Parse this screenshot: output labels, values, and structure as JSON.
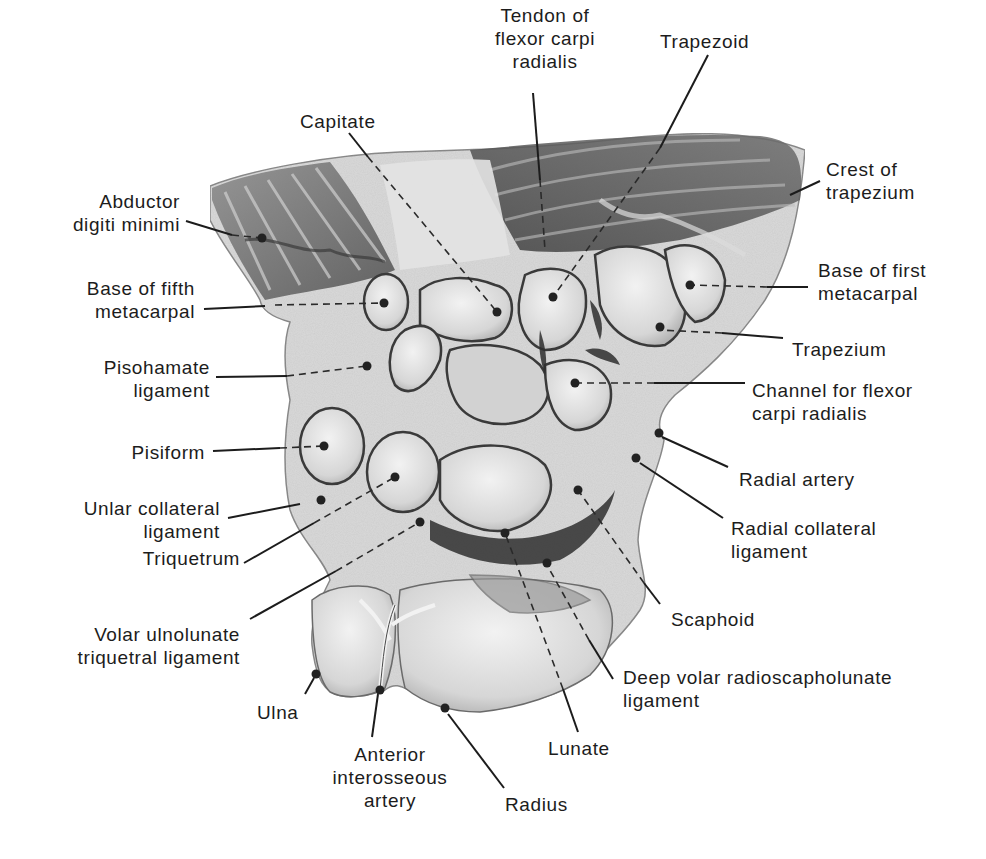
{
  "figure": {
    "labels": [
      {
        "id": "tendon-fcr",
        "text": "Tendon of\nflexor carpi\nradialis",
        "x": 470,
        "y": 4,
        "w": 150,
        "align": "center",
        "line": [
          [
            533,
            93
          ],
          [
            540,
            180
          ]
        ],
        "dash": [
          [
            540,
            180
          ],
          [
            545,
            250
          ]
        ],
        "dot": null
      },
      {
        "id": "trapezoid",
        "text": "Trapezoid",
        "x": 660,
        "y": 30,
        "w": 120,
        "align": "left",
        "line": [
          [
            708,
            55
          ],
          [
            660,
            148
          ]
        ],
        "dash": [
          [
            660,
            148
          ],
          [
            553,
            297
          ]
        ],
        "dot": [
          553,
          297
        ]
      },
      {
        "id": "capitate",
        "text": "Capitate",
        "x": 300,
        "y": 110,
        "w": 100,
        "align": "left",
        "line": [
          [
            349,
            133
          ],
          [
            368,
            157
          ]
        ],
        "dash": [
          [
            368,
            157
          ],
          [
            497,
            312
          ]
        ],
        "dot": [
          497,
          312
        ]
      },
      {
        "id": "crest-of-trapezium",
        "text": "Crest of\ntrapezium",
        "x": 826,
        "y": 158,
        "w": 140,
        "align": "left",
        "line": [
          [
            820,
            181
          ],
          [
            790,
            195
          ]
        ],
        "dash": null,
        "dot": null
      },
      {
        "id": "abductor-digiti-minimi",
        "text": "Abductor\ndigiti minimi",
        "x": 40,
        "y": 190,
        "w": 140,
        "align": "right",
        "line": [
          [
            186,
            221
          ],
          [
            232,
            235
          ]
        ],
        "dash": [
          [
            232,
            235
          ],
          [
            262,
            238
          ]
        ],
        "dot": [
          262,
          238
        ]
      },
      {
        "id": "base-of-fifth-metacarpal",
        "text": "Base of fifth\nmetacarpal",
        "x": 20,
        "y": 277,
        "w": 175,
        "align": "right",
        "line": [
          [
            204,
            309
          ],
          [
            265,
            306
          ]
        ],
        "dash": [
          [
            275,
            305
          ],
          [
            384,
            303
          ]
        ],
        "dot": [
          384,
          303
        ]
      },
      {
        "id": "base-of-first-metacarpal",
        "text": "Base of first\nmetacarpal",
        "x": 818,
        "y": 259,
        "w": 150,
        "align": "left",
        "line": [
          [
            808,
            287
          ],
          [
            767,
            287
          ]
        ],
        "dash": [
          [
            767,
            287
          ],
          [
            690,
            285
          ]
        ],
        "dot": [
          690,
          285
        ]
      },
      {
        "id": "trapezium",
        "text": "Trapezium",
        "x": 792,
        "y": 338,
        "w": 140,
        "align": "left",
        "line": [
          [
            783,
            338
          ],
          [
            722,
            333
          ]
        ],
        "dash": [
          [
            722,
            333
          ],
          [
            660,
            330
          ]
        ],
        "dot": [
          660,
          327
        ]
      },
      {
        "id": "pisohamate-ligament",
        "text": "Pisohamate\nligament",
        "x": 40,
        "y": 356,
        "w": 170,
        "align": "right",
        "line": [
          [
            216,
            377
          ],
          [
            287,
            376
          ]
        ],
        "dash": [
          [
            287,
            376
          ],
          [
            367,
            366
          ]
        ],
        "dot": [
          367,
          366
        ]
      },
      {
        "id": "channel-fcr",
        "text": "Channel for flexor\ncarpi radialis",
        "x": 752,
        "y": 379,
        "w": 210,
        "align": "left",
        "line": [
          [
            745,
            383
          ],
          [
            654,
            383
          ]
        ],
        "dash": [
          [
            654,
            383
          ],
          [
            575,
            383
          ]
        ],
        "dot": [
          575,
          383
        ]
      },
      {
        "id": "pisiform",
        "text": "Pisiform",
        "x": 95,
        "y": 441,
        "w": 110,
        "align": "right",
        "line": [
          [
            213,
            451
          ],
          [
            280,
            448
          ]
        ],
        "dash": [
          [
            280,
            448
          ],
          [
            324,
            446
          ]
        ],
        "dot": [
          324,
          446
        ]
      },
      {
        "id": "radial-artery",
        "text": "Radial artery",
        "x": 739,
        "y": 468,
        "w": 160,
        "align": "left",
        "line": [
          [
            728,
            467
          ],
          [
            662,
            437
          ]
        ],
        "dash": null,
        "dot": [
          659,
          433
        ]
      },
      {
        "id": "ulnar-collateral-ligament",
        "text": "Unlar collateral\nligament",
        "x": 30,
        "y": 497,
        "w": 190,
        "align": "right",
        "line": [
          [
            228,
            518
          ],
          [
            300,
            504
          ]
        ],
        "dash": null,
        "dot": [
          321,
          500
        ]
      },
      {
        "id": "radial-collateral-ligament",
        "text": "Radial collateral\nligament",
        "x": 731,
        "y": 517,
        "w": 180,
        "align": "left",
        "line": [
          [
            723,
            518
          ],
          [
            640,
            463
          ]
        ],
        "dash": null,
        "dot": [
          636,
          458
        ]
      },
      {
        "id": "triquetrum",
        "text": "Triquetrum",
        "x": 110,
        "y": 547,
        "w": 130,
        "align": "right",
        "line": [
          [
            244,
            563
          ],
          [
            314,
            523
          ]
        ],
        "dash": [
          [
            314,
            523
          ],
          [
            395,
            477
          ]
        ],
        "dot": [
          395,
          477
        ]
      },
      {
        "id": "volar-ulnolunate-triquetral-ligament",
        "text": "Volar ulnolunate\ntriquetral ligament",
        "x": 40,
        "y": 623,
        "w": 200,
        "align": "right",
        "line": [
          [
            250,
            619
          ],
          [
            336,
            571
          ]
        ],
        "dash": [
          [
            336,
            571
          ],
          [
            420,
            522
          ]
        ],
        "dot": [
          420,
          522
        ]
      },
      {
        "id": "scaphoid",
        "text": "Scaphoid",
        "x": 671,
        "y": 608,
        "w": 120,
        "align": "left",
        "line": [
          [
            660,
            604
          ],
          [
            644,
            583
          ]
        ],
        "dash": [
          [
            644,
            583
          ],
          [
            578,
            490
          ]
        ],
        "dot": [
          578,
          490
        ]
      },
      {
        "id": "deep-volar-radioscapholunate-ligament",
        "text": "Deep volar radioscapholunate\nligament",
        "x": 623,
        "y": 666,
        "w": 320,
        "align": "left",
        "line": [
          [
            613,
            679
          ],
          [
            589,
            640
          ]
        ],
        "dash": [
          [
            589,
            640
          ],
          [
            547,
            565
          ]
        ],
        "dot": [
          547,
          563
        ]
      },
      {
        "id": "ulna",
        "text": "Ulna",
        "x": 257,
        "y": 701,
        "w": 60,
        "align": "left",
        "line": [
          [
            305,
            694
          ],
          [
            314,
            678
          ]
        ],
        "dash": null,
        "dot": [
          316,
          674
        ]
      },
      {
        "id": "lunate",
        "text": "Lunate",
        "x": 548,
        "y": 737,
        "w": 90,
        "align": "left",
        "line": [
          [
            578,
            732
          ],
          [
            563,
            689
          ]
        ],
        "dash": [
          [
            563,
            689
          ],
          [
            505,
            533
          ]
        ],
        "dot": [
          505,
          533
        ]
      },
      {
        "id": "anterior-interosseous-artery",
        "text": "Anterior\ninterosseous\nartery",
        "x": 320,
        "y": 743,
        "w": 140,
        "align": "center",
        "line": [
          [
            372,
            737
          ],
          [
            378,
            694
          ]
        ],
        "dash": null,
        "dot": [
          380,
          690
        ]
      },
      {
        "id": "radius",
        "text": "Radius",
        "x": 505,
        "y": 793,
        "w": 90,
        "align": "left",
        "line": [
          [
            504,
            788
          ],
          [
            448,
            714
          ]
        ],
        "dash": null,
        "dot": [
          445,
          708
        ]
      }
    ],
    "colors": {
      "ink": "#1c1c1c",
      "bone_light": "#e6e6e6",
      "bone_mid": "#c9c9c9",
      "tissue_dark": "#6a6a6a",
      "shadow": "#3a3a3a"
    }
  }
}
